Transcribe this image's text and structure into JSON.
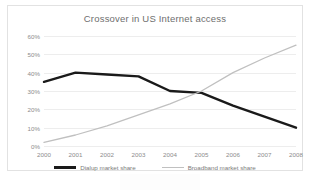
{
  "chart_data": {
    "type": "line",
    "title": "Crossover in US Internet access",
    "xlabel": "",
    "ylabel": "",
    "x": [
      "2000",
      "2001",
      "2002",
      "2003",
      "2004",
      "2005",
      "2006",
      "2007",
      "2008"
    ],
    "categories": [
      "2000",
      "2001",
      "2002",
      "2003",
      "2004",
      "2005",
      "2006",
      "2007",
      "2008"
    ],
    "ylim": [
      0,
      60
    ],
    "yticks": [
      0,
      10,
      20,
      30,
      40,
      50,
      60
    ],
    "ytick_labels": [
      "0%",
      "10%",
      "20%",
      "30%",
      "40%",
      "50%",
      "60%"
    ],
    "grid": true,
    "legend_position": "bottom",
    "series": [
      {
        "name": "Dialup market share",
        "color": "#1a1a1a",
        "width": 2.4,
        "values": [
          35,
          40,
          39,
          38,
          30,
          29,
          22,
          16,
          10
        ]
      },
      {
        "name": "Broadband market share",
        "color": "#c0c0c0",
        "width": 1.3,
        "values": [
          2,
          6,
          11,
          17,
          23,
          30,
          40,
          48,
          55
        ]
      }
    ],
    "annotations": []
  },
  "legend": {
    "items": [
      {
        "label": "Dialup market share"
      },
      {
        "label": "Broadband market share"
      }
    ]
  }
}
